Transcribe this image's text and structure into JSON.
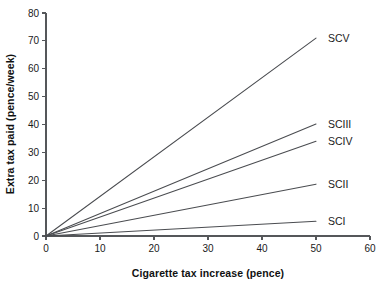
{
  "chart_data": {
    "type": "line",
    "title": "",
    "xlabel": "Cigarette tax increase (pence)",
    "ylabel": "Extra tax paid (pence/week)",
    "xlim": [
      0,
      60
    ],
    "ylim": [
      0,
      80
    ],
    "xticks": [
      0,
      10,
      20,
      30,
      40,
      50,
      60
    ],
    "yticks": [
      0,
      10,
      20,
      30,
      40,
      50,
      60,
      70,
      80
    ],
    "xtick_labels": [
      "0",
      "10",
      "20",
      "30",
      "40",
      "50",
      "60"
    ],
    "ytick_labels": [
      "0",
      "10",
      "20",
      "30",
      "40",
      "50",
      "60",
      "70",
      "80"
    ],
    "grid": false,
    "legend": "inline-right-of-line-end",
    "line_color": "#4a4c50",
    "axis_color": "#55575a",
    "background": "#ffffff",
    "x": [
      0,
      50
    ],
    "series": [
      {
        "name": "SCV",
        "label": "SCV",
        "values": [
          0,
          71.0
        ],
        "label_x": 52.2,
        "label_y": 71.0
      },
      {
        "name": "SCIII",
        "label": "SCIII",
        "values": [
          0,
          40.2
        ],
        "label_x": 52.2,
        "label_y": 40.2
      },
      {
        "name": "SCIV",
        "label": "SCIV",
        "values": [
          0,
          34.0
        ],
        "label_x": 52.2,
        "label_y": 34.0
      },
      {
        "name": "SCII",
        "label": "SCII",
        "values": [
          0,
          18.6
        ],
        "label_x": 52.2,
        "label_y": 18.6
      },
      {
        "name": "SCI",
        "label": "SCI",
        "values": [
          0,
          5.3
        ],
        "label_x": 52.2,
        "label_y": 5.3
      }
    ]
  }
}
